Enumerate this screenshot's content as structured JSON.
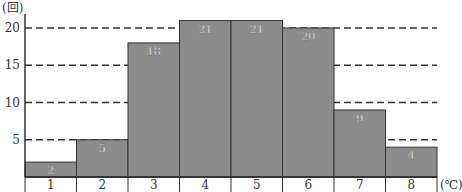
{
  "chart_data": {
    "type": "bar",
    "title": "",
    "xlabel": "(℃)",
    "ylabel": "(回)",
    "categories": [
      "1",
      "2",
      "3",
      "4",
      "5",
      "6",
      "7",
      "8"
    ],
    "values": [
      2,
      5,
      18,
      21,
      21,
      20,
      9,
      4
    ],
    "ylim": [
      0,
      22
    ],
    "yticks": [
      5,
      10,
      15,
      20
    ],
    "grid": "dashed horizontal lines at 5, 10, 15, 20",
    "legend": null,
    "bar_style": "histogram (adjacent bars, no gaps), value labels inside top of each bar",
    "colors": {
      "bar_fill": "#8c8c8c",
      "bar_stroke": "#333333",
      "label_text": "#ffffff",
      "axis": "#333333",
      "grid": "#333333"
    }
  }
}
